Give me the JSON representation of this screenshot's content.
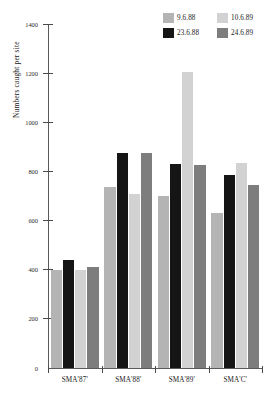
{
  "chart_data": {
    "type": "bar",
    "title": "",
    "xlabel": "",
    "ylabel": "Numbers caught per site",
    "categories": [
      "SMA'87'",
      "SMA'88'",
      "SMA'89'",
      "SMA'C'"
    ],
    "series": [
      {
        "name": "9.6.88",
        "color": "#b4b4b4",
        "values": [
          400,
          735,
          700,
          630
        ]
      },
      {
        "name": "23.6.88",
        "color": "#151515",
        "values": [
          440,
          875,
          830,
          785
        ]
      },
      {
        "name": "10.6.89",
        "color": "#d2d2d2",
        "values": [
          400,
          710,
          1205,
          835
        ]
      },
      {
        "name": "24.6.89",
        "color": "#7d7d7d",
        "values": [
          410,
          875,
          825,
          745
        ]
      }
    ],
    "ylim": [
      0,
      1400
    ],
    "yticks": [
      0,
      200,
      400,
      600,
      800,
      1000,
      1200,
      1400
    ],
    "ytick_labels": [
      "0",
      "200",
      "400",
      "600",
      "800",
      "1000",
      "1200",
      "1400"
    ],
    "grid": false,
    "legend_position": "top-right"
  },
  "legend": {
    "entries": [
      {
        "label": "9.6.88",
        "color": "#b4b4b4"
      },
      {
        "label": "23.6.88",
        "color": "#151515"
      },
      {
        "label": "10.6.89",
        "color": "#d2d2d2"
      },
      {
        "label": "24.6.89",
        "color": "#7d7d7d"
      }
    ]
  },
  "axes": {
    "y_title": "Numbers caught per site",
    "y_tick_labels": [
      "1400",
      "1200",
      "1000",
      "800",
      "600",
      "400",
      "200",
      "0"
    ],
    "x_tick_labels": [
      "SMA'87'",
      "SMA'88'",
      "SMA'89'",
      "SMA'C'"
    ]
  }
}
